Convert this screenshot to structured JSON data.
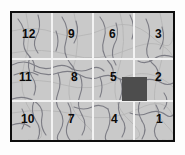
{
  "figure": {
    "type": "region-grid-map",
    "width": 185,
    "height": 155
  },
  "colors": {
    "background": "#ffffff",
    "map_fill": "#c9c9c9",
    "frame": "#0d0d0d",
    "grid_line": "#f2f2f2",
    "river": "#7d7d85",
    "highlight_block": "#4d4d4d",
    "label_text": "#0a0a0a"
  },
  "grid": {
    "columns": 4,
    "rows": 3,
    "cell_count": 12,
    "highlighted_cell": "5"
  },
  "cells": [
    {
      "label": "12",
      "row": 1,
      "col": 1,
      "x": 22,
      "y": 28
    },
    {
      "label": "9",
      "row": 1,
      "col": 2,
      "x": 68,
      "y": 28
    },
    {
      "label": "6",
      "row": 1,
      "col": 3,
      "x": 109,
      "y": 28
    },
    {
      "label": "3",
      "row": 1,
      "col": 4,
      "x": 155,
      "y": 28
    },
    {
      "label": "11",
      "row": 2,
      "col": 1,
      "x": 19,
      "y": 71
    },
    {
      "label": "8",
      "row": 2,
      "col": 2,
      "x": 71,
      "y": 71
    },
    {
      "label": "5",
      "row": 2,
      "col": 3,
      "x": 110,
      "y": 71
    },
    {
      "label": "2",
      "row": 2,
      "col": 4,
      "x": 155,
      "y": 71
    },
    {
      "label": "10",
      "row": 3,
      "col": 1,
      "x": 21,
      "y": 113
    },
    {
      "label": "7",
      "row": 3,
      "col": 2,
      "x": 68,
      "y": 113
    },
    {
      "label": "4",
      "row": 3,
      "col": 3,
      "x": 111,
      "y": 113
    },
    {
      "label": "1",
      "row": 3,
      "col": 4,
      "x": 156,
      "y": 113
    }
  ]
}
